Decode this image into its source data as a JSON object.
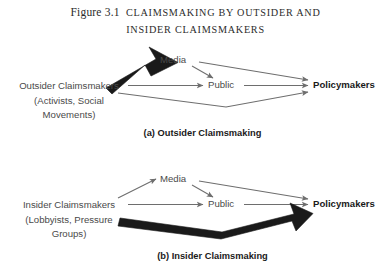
{
  "figure": {
    "number": "Figure 3.1",
    "title_line1": "Claimsmaking by Outsider and",
    "title_line2": "Insider Claimsmakers"
  },
  "colors": {
    "thin_arrow": "#6e6e6e",
    "thick_arrow": "#1a1a1a",
    "label_text": "#4a4a4a",
    "emphasis_text": "#1a1a1a",
    "background": "#ffffff"
  },
  "panels": [
    {
      "id": "a",
      "caption": "(a) Outsider Claimsmaking",
      "source": {
        "line1": "Outsider Claimsmakers",
        "line2": "(Activists, Social",
        "line3": "Movements)"
      },
      "nodes": {
        "media": "Media",
        "public": "Public",
        "policymakers": "Policymakers"
      },
      "edges": [
        {
          "from": "Outsider Claimsmakers",
          "to": "Media",
          "weight": "thick"
        },
        {
          "from": "Outsider Claimsmakers",
          "to": "Public",
          "weight": "thin"
        },
        {
          "from": "Outsider Claimsmakers",
          "to": "Policymakers",
          "weight": "thin"
        },
        {
          "from": "Media",
          "to": "Public",
          "weight": "thin"
        },
        {
          "from": "Media",
          "to": "Policymakers",
          "weight": "thin"
        },
        {
          "from": "Public",
          "to": "Policymakers",
          "weight": "thin"
        }
      ]
    },
    {
      "id": "b",
      "caption": "(b) Insider Claimsmaking",
      "source": {
        "line1": "Insider Claimsmakers",
        "line2": "(Lobbyists, Pressure",
        "line3": "Groups)"
      },
      "nodes": {
        "media": "Media",
        "public": "Public",
        "policymakers": "Policymakers"
      },
      "edges": [
        {
          "from": "Insider Claimsmakers",
          "to": "Media",
          "weight": "thin"
        },
        {
          "from": "Insider Claimsmakers",
          "to": "Public",
          "weight": "thin"
        },
        {
          "from": "Insider Claimsmakers",
          "to": "Policymakers",
          "weight": "thick"
        },
        {
          "from": "Media",
          "to": "Public",
          "weight": "thin"
        },
        {
          "from": "Media",
          "to": "Policymakers",
          "weight": "thin"
        },
        {
          "from": "Public",
          "to": "Policymakers",
          "weight": "thin"
        }
      ]
    }
  ]
}
